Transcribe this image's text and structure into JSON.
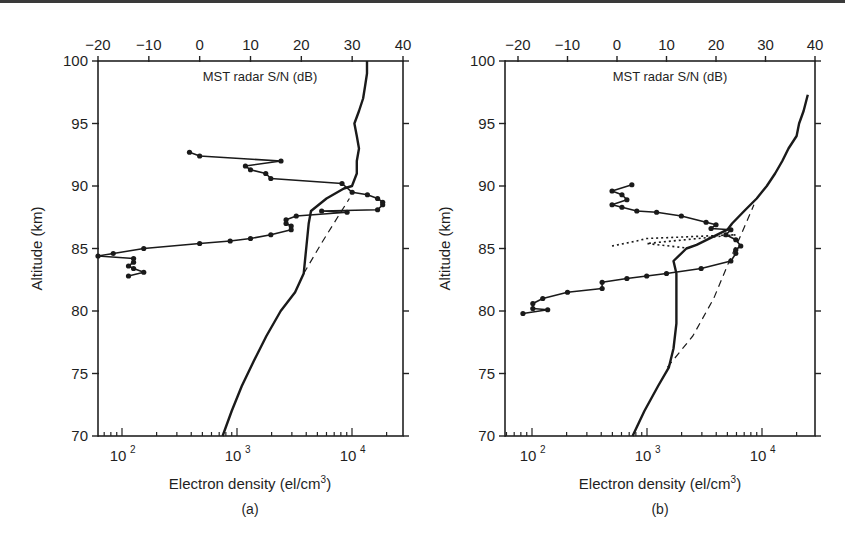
{
  "chart_data": [
    {
      "type": "line",
      "panel_label": "(a)",
      "title": "MST radar S/N (dB)",
      "xlabel": "Electron density (el/cm3)",
      "xlabel_base": "Electron density (el/cm",
      "xlabel_sup": "3",
      "xlabel_end": ")",
      "ylabel": "Altitude (km)",
      "top_xlabel": "MST radar S/N (dB)",
      "xscale": "log",
      "xlim": [
        70,
        25000
      ],
      "ylim": [
        70,
        100
      ],
      "top_xlim": [
        -20,
        40
      ],
      "x_ticks": [
        "10^2",
        "10^3",
        "10^4"
      ],
      "y_ticks": [
        70,
        75,
        80,
        85,
        90,
        95,
        100
      ],
      "top_x_ticks": [
        -20,
        -10,
        0,
        10,
        20,
        30,
        40
      ],
      "grid": false,
      "series": [
        {
          "name": "Electron density profile",
          "style": "solid",
          "axis": "bottom",
          "points": [
            [
              750,
              70
            ],
            [
              900,
              72
            ],
            [
              1100,
              74
            ],
            [
              1400,
              76
            ],
            [
              1800,
              78
            ],
            [
              2400,
              80
            ],
            [
              3200,
              81.5
            ],
            [
              3800,
              83
            ],
            [
              4000,
              85
            ],
            [
              4200,
              87
            ],
            [
              4400,
              88
            ],
            [
              6000,
              89
            ],
            [
              8500,
              89.8
            ],
            [
              10000,
              90
            ],
            [
              11000,
              91
            ],
            [
              11000,
              92
            ],
            [
              11500,
              93
            ],
            [
              11000,
              94
            ],
            [
              10500,
              95
            ],
            [
              11500,
              96
            ],
            [
              12500,
              97
            ],
            [
              13000,
              98
            ],
            [
              13500,
              99
            ],
            [
              13500,
              100
            ]
          ]
        },
        {
          "name": "Extrapolated profile",
          "style": "dashed",
          "axis": "bottom",
          "points": [
            [
              3800,
              83
            ],
            [
              5500,
              85.5
            ],
            [
              7500,
              87.5
            ],
            [
              9500,
              89
            ]
          ]
        },
        {
          "name": "MST radar S/N",
          "style": "solid-with-markers",
          "axis": "top",
          "points": [
            [
              -2,
              92.7
            ],
            [
              0,
              92.4
            ],
            [
              16,
              92.0
            ],
            [
              9,
              91.6
            ],
            [
              10,
              91.3
            ],
            [
              13,
              91.0
            ],
            [
              14,
              90.6
            ],
            [
              28,
              90.2
            ],
            [
              30,
              89.5
            ],
            [
              33,
              89.3
            ],
            [
              35,
              89.0
            ],
            [
              36,
              88.7
            ],
            [
              36,
              88.5
            ],
            [
              35,
              88.1
            ],
            [
              24,
              88.0
            ],
            [
              29,
              87.9
            ],
            [
              19,
              87.6
            ],
            [
              17,
              87.3
            ],
            [
              17,
              87.0
            ],
            [
              18,
              86.8
            ],
            [
              18,
              86.5
            ],
            [
              14,
              86.1
            ],
            [
              10,
              85.8
            ],
            [
              6,
              85.6
            ],
            [
              0,
              85.4
            ],
            [
              -11,
              85.0
            ],
            [
              -17,
              84.6
            ],
            [
              -20,
              84.4
            ],
            [
              -13,
              84.2
            ],
            [
              -13,
              83.9
            ],
            [
              -14,
              83.6
            ],
            [
              -13,
              83.4
            ],
            [
              -11,
              83.1
            ],
            [
              -14,
              82.8
            ]
          ]
        }
      ]
    },
    {
      "type": "line",
      "panel_label": "(b)",
      "title": "MST radar S/N (dB)",
      "xlabel": "Electron density (el/cm3)",
      "xlabel_base": "Electron density (el/cm",
      "xlabel_sup": "3",
      "xlabel_end": ")",
      "ylabel": "Altitude (km)",
      "top_xlabel": "MST radar S/N (dB)",
      "xscale": "log",
      "xlim": [
        60,
        25000
      ],
      "ylim": [
        70,
        100
      ],
      "top_xlim": [
        -20,
        40
      ],
      "x_ticks": [
        "10^2",
        "10^3",
        "10^4"
      ],
      "y_ticks": [
        70,
        75,
        80,
        85,
        90,
        95,
        100
      ],
      "top_x_ticks": [
        -20,
        -10,
        0,
        10,
        20,
        30,
        40
      ],
      "grid": false,
      "series": [
        {
          "name": "Electron density profile",
          "style": "solid",
          "axis": "bottom",
          "points": [
            [
              750,
              70
            ],
            [
              950,
              72
            ],
            [
              1250,
              74
            ],
            [
              1550,
              75.5
            ],
            [
              1700,
              77
            ],
            [
              1800,
              79
            ],
            [
              1800,
              81
            ],
            [
              1800,
              83
            ],
            [
              1700,
              84
            ],
            [
              2200,
              85
            ],
            [
              2700,
              85.3
            ],
            [
              5000,
              86.5
            ],
            [
              5500,
              87
            ],
            [
              7000,
              88
            ],
            [
              9000,
              89
            ],
            [
              11000,
              90
            ],
            [
              13000,
              91
            ],
            [
              15000,
              92
            ],
            [
              17000,
              93
            ],
            [
              20000,
              94
            ],
            [
              21000,
              95
            ],
            [
              23000,
              96
            ],
            [
              25000,
              97.3
            ]
          ]
        },
        {
          "name": "Extrapolated profile",
          "style": "dashed",
          "axis": "bottom",
          "points": [
            [
              1500,
              75.5
            ],
            [
              2500,
              78
            ],
            [
              3800,
              81
            ],
            [
              5200,
              84
            ],
            [
              6500,
              86
            ],
            [
              8500,
              88.5
            ]
          ]
        },
        {
          "name": "MST radar S/N",
          "style": "solid-with-markers",
          "axis": "top",
          "points": [
            [
              3,
              90.1
            ],
            [
              -1,
              89.6
            ],
            [
              1,
              89.3
            ],
            [
              2,
              88.9
            ],
            [
              -1,
              88.5
            ],
            [
              1,
              88.3
            ],
            [
              4,
              88.0
            ],
            [
              8,
              87.9
            ],
            [
              13,
              87.6
            ],
            [
              18,
              87.1
            ],
            [
              20,
              86.9
            ],
            [
              19,
              86.6
            ],
            [
              23,
              86.5
            ],
            [
              22,
              86.1
            ],
            [
              24,
              85.7
            ],
            [
              25,
              85.2
            ],
            [
              24,
              84.9
            ],
            [
              24,
              84.6
            ],
            [
              23,
              84.0
            ],
            [
              17,
              83.4
            ],
            [
              10,
              83.0
            ],
            [
              6,
              82.8
            ],
            [
              2,
              82.6
            ],
            [
              -3,
              82.3
            ],
            [
              -3,
              81.8
            ],
            [
              -10,
              81.5
            ],
            [
              -15,
              81.0
            ],
            [
              -17,
              80.6
            ],
            [
              -17,
              80.2
            ],
            [
              -14,
              80.1
            ],
            [
              -19,
              79.8
            ]
          ]
        },
        {
          "name": "MST radar S/N (dotted segment)",
          "style": "dotted",
          "axis": "top",
          "points": [
            [
              -1,
              85.2
            ],
            [
              4,
              85.6
            ],
            [
              6,
              85.8
            ],
            [
              18,
              86.0
            ],
            [
              24,
              86.1
            ],
            [
              6,
              85.4
            ],
            [
              15,
              85.0
            ]
          ]
        }
      ]
    }
  ],
  "panels": [
    {
      "label": "(a)",
      "top_title": "MST radar S/N (dB)",
      "xlabel_base": "Electron density (el/cm",
      "xlabel_sup": "3",
      "xlabel_end": ")",
      "ylabel": "Altitude (km)"
    },
    {
      "label": "(b)",
      "top_title": "MST radar S/N (dB)",
      "xlabel_base": "Electron density (el/cm",
      "xlabel_sup": "3",
      "xlabel_end": ")",
      "ylabel": "Altitude (km)"
    }
  ]
}
